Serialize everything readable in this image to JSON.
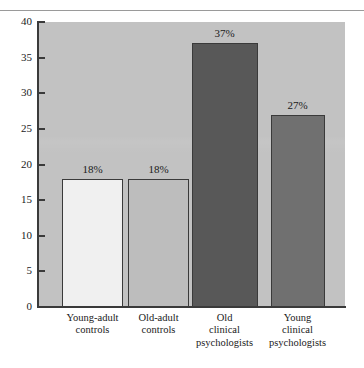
{
  "figure": {
    "background": "#ffffff",
    "plot_background": "#c2c2c2",
    "axis_color": "#3a3a3a"
  },
  "chart_data": {
    "type": "bar",
    "title": "",
    "subtitle": "",
    "xlabel": "",
    "ylabel": "",
    "categories": [
      "Young-adult\ncontrols",
      "Old-adult\ncontrols",
      "Old\nclinical\npsychologists",
      "Young\nclinical\npsychologists"
    ],
    "values": [
      18,
      18,
      37,
      27
    ],
    "data_labels": [
      "18%",
      "18%",
      "37%",
      "27%"
    ],
    "bar_colors": [
      "#f0f0f0",
      "#bdbdbd",
      "#585858",
      "#707070"
    ],
    "bar_edge_color": "#3a3a3a",
    "ylim": [
      0,
      40
    ],
    "yticks": [
      0,
      5,
      10,
      15,
      20,
      25,
      30,
      35,
      40
    ],
    "ytick_labels": [
      "0",
      "5",
      "10",
      "15",
      "20",
      "25",
      "30",
      "35",
      "40"
    ],
    "grid": false,
    "legend": null
  }
}
